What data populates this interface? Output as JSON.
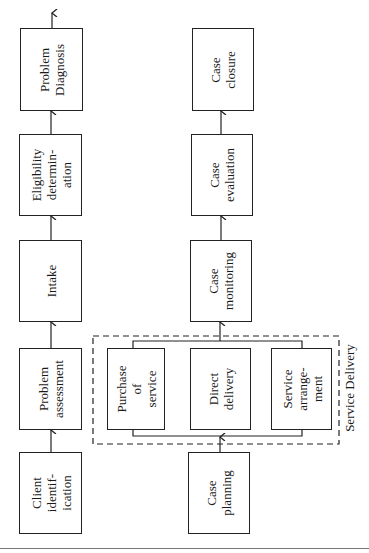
{
  "diagram": {
    "flow_a": [
      {
        "id": "client-identification",
        "label": "Client\nidentif-\nication"
      },
      {
        "id": "problem-assessment",
        "label": "Problem\nassessment"
      },
      {
        "id": "intake",
        "label": "Intake"
      },
      {
        "id": "eligibility-determination",
        "label": "Eligibility\ndetermin-\nation"
      },
      {
        "id": "problem-diagnosis",
        "label": "Problem\nDiagnosis"
      }
    ],
    "flow_b": [
      {
        "id": "case-planning",
        "label": "Case\nplanning"
      },
      {
        "id": "purchase-of-service",
        "label": "Purchase\nof\nservice"
      },
      {
        "id": "direct-delivery",
        "label": "Direct\ndelivery"
      },
      {
        "id": "service-arrangement",
        "label": "Service\narrange-\nment"
      },
      {
        "id": "case-monitoring",
        "label": "Case\nmonitoring"
      },
      {
        "id": "case-evaluation",
        "label": "Case\nevaluation"
      },
      {
        "id": "case-closure",
        "label": "Case\nclosure"
      }
    ],
    "group_label": "Service Delivery"
  }
}
